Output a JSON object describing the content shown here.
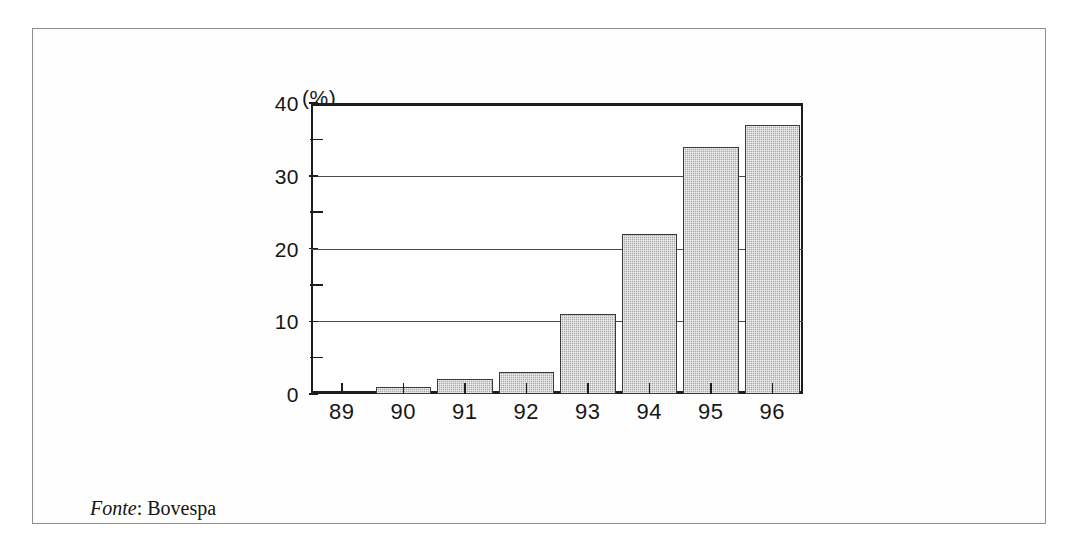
{
  "figure": {
    "unit_label": "(%)",
    "source_prefix": "Fonte",
    "source_separator": ": ",
    "source_name": "Bovespa"
  },
  "chart_data": {
    "type": "bar",
    "title": "",
    "subtitle": "",
    "xlabel": "",
    "ylabel": "(%)",
    "categories": [
      "89",
      "90",
      "91",
      "92",
      "93",
      "94",
      "95",
      "96"
    ],
    "values": [
      0,
      1,
      2,
      3,
      11,
      22,
      34,
      37
    ],
    "ylim": [
      0,
      40
    ],
    "y_major_ticks": [
      0,
      10,
      20,
      30,
      40
    ],
    "y_minor_ticks": [
      5,
      15,
      25,
      35
    ],
    "y_tick_labels": [
      "0",
      "10",
      "20",
      "30",
      "40"
    ],
    "grid": "horizontal-major-only",
    "legend": "none",
    "series": [
      {
        "name": "",
        "values": [
          0,
          1,
          2,
          3,
          11,
          22,
          34,
          37
        ]
      }
    ],
    "bar_fill": "#a8a8a8",
    "bar_edge": "#3a3a3a",
    "axis_color": "#1d1d1d",
    "grid_color": "#4a4a4a"
  }
}
